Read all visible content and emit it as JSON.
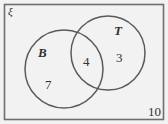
{
  "diagram": {
    "type": "venn",
    "universal_symbol": "ξ",
    "sets": [
      {
        "name": "B",
        "only_count": "7"
      },
      {
        "name": "T",
        "only_count": "3"
      }
    ],
    "intersection_count": "4",
    "outside_count": "10",
    "colors": {
      "background": "#f2f2f2",
      "stroke": "#5a5a5a",
      "text": "#333333"
    }
  }
}
